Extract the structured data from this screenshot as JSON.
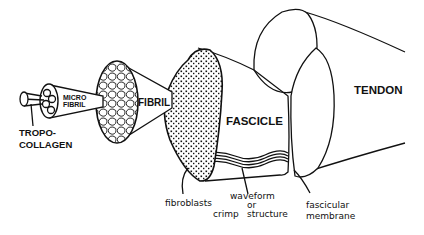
{
  "diagram": {
    "background": "#ffffff",
    "ink_color": "#111111",
    "labels": {
      "tropocollagen_line1": "TROPO-",
      "tropocollagen_line2": "COLLAGEN",
      "microfibril_line1": "MICRO",
      "microfibril_line2": "FIBRIL",
      "fibril": "FIBRIL",
      "fascicle": "FASCICLE",
      "tendon": "TENDON",
      "fibroblasts": "fibroblasts",
      "waveform_line1": "waveform",
      "waveform_line2": "or",
      "crimp": "crimp",
      "structure": "structure",
      "fascicular_line1": "fascicular",
      "fascicular_line2": "membrane"
    },
    "hierarchy": [
      "Tropocollagen",
      "Microfibril",
      "Fibril",
      "Fascicle",
      "Tendon"
    ]
  }
}
